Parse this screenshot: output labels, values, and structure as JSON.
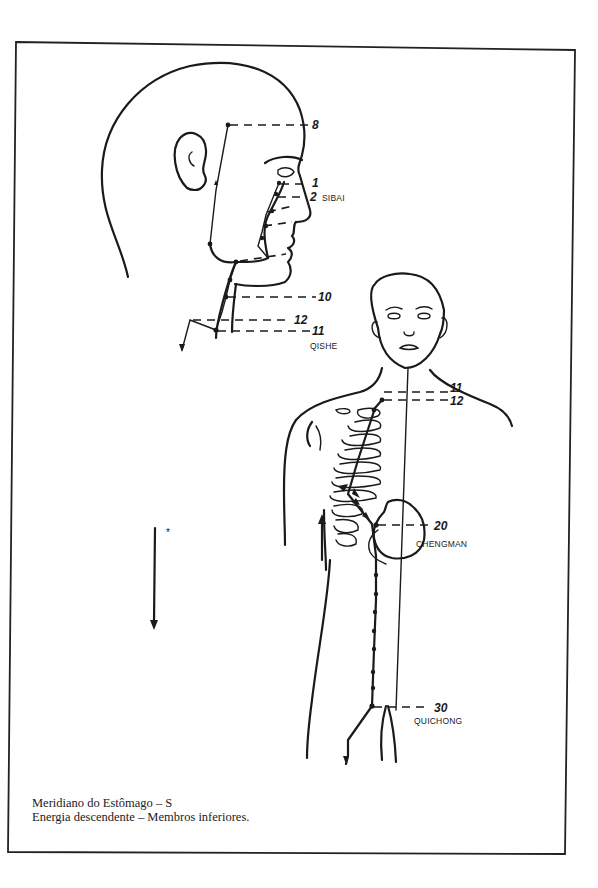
{
  "figure": {
    "title": "Meridiano do Estômago – S",
    "subtitle": "Energia descendente – Membros inferiores.",
    "direction_marker": "*"
  },
  "points": {
    "p8": {
      "number": "8"
    },
    "p1": {
      "number": "1"
    },
    "p2": {
      "number": "2",
      "name": "SIBAI"
    },
    "p10": {
      "number": "10"
    },
    "p12_head": {
      "number": "12"
    },
    "p11_head": {
      "number": "11",
      "name": "QISHE"
    },
    "p11_body": {
      "number": "11"
    },
    "p12_body": {
      "number": "12"
    },
    "p20": {
      "number": "20",
      "name": "CHENGMAN"
    },
    "p30": {
      "number": "30",
      "name": "QUICHONG"
    }
  },
  "colors": {
    "ink": "#1a1a1a",
    "paper": "#ffffff"
  }
}
